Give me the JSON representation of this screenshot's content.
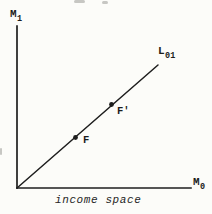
{
  "figure": {
    "ink": "#1e1e1e",
    "background": "#fcfcf9",
    "axes": {
      "y_label": "M",
      "y_label_sub": "1",
      "x_label": "M",
      "x_label_sub": "0",
      "origin_x": 17,
      "origin_y": 188,
      "y_axis_top": 26,
      "x_axis_right": 191
    },
    "ray": {
      "label": "L",
      "label_sub": "01",
      "x1": 17,
      "y1": 188,
      "x2": 158,
      "y2": 65
    },
    "points": [
      {
        "label": "F",
        "x": 75.5,
        "y": 137.5
      },
      {
        "label": "F'",
        "x": 111.5,
        "y": 104.5
      }
    ],
    "caption": "income space"
  }
}
